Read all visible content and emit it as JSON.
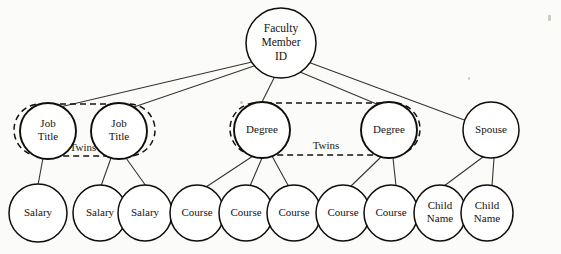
{
  "diagram": {
    "background_color": "#fbfbfa",
    "stroke_color": "#100d0b",
    "edge_color": "#3a332d",
    "nodes": [
      {
        "id": "root",
        "label_lines": [
          "Faculty",
          "Member",
          "ID"
        ],
        "cx": 281,
        "cy": 43,
        "rx": 35,
        "ry": 35,
        "font_size": 11.5,
        "stroke_width": 1.5
      },
      {
        "id": "job1",
        "label_lines": [
          "Job",
          "Title"
        ],
        "cx": 48,
        "cy": 131,
        "rx": 28,
        "ry": 28,
        "font_size": 11,
        "stroke_width": 1.9
      },
      {
        "id": "job2",
        "label_lines": [
          "Job",
          "Title"
        ],
        "cx": 119,
        "cy": 131,
        "rx": 28,
        "ry": 28,
        "font_size": 11,
        "stroke_width": 1.9
      },
      {
        "id": "degree1",
        "label_lines": [
          "Degree"
        ],
        "cx": 262,
        "cy": 130,
        "rx": 28,
        "ry": 28,
        "font_size": 11,
        "stroke_width": 1.9
      },
      {
        "id": "degree2",
        "label_lines": [
          "Degree"
        ],
        "cx": 389,
        "cy": 130,
        "rx": 28,
        "ry": 28,
        "font_size": 11,
        "stroke_width": 1.9
      },
      {
        "id": "spouse",
        "label_lines": [
          "Spouse"
        ],
        "cx": 491,
        "cy": 130,
        "rx": 28,
        "ry": 28,
        "font_size": 11,
        "stroke_width": 1.5
      },
      {
        "id": "salary1",
        "label_lines": [
          "Salary"
        ],
        "cx": 38,
        "cy": 213,
        "rx": 29,
        "ry": 29,
        "font_size": 11,
        "stroke_width": 1.5
      },
      {
        "id": "salary2",
        "label_lines": [
          "Salary"
        ],
        "cx": 100,
        "cy": 213,
        "rx": 27,
        "ry": 28,
        "font_size": 11,
        "stroke_width": 1.5
      },
      {
        "id": "salary3",
        "label_lines": [
          "Salary"
        ],
        "cx": 145,
        "cy": 213,
        "rx": 27,
        "ry": 28,
        "font_size": 11,
        "stroke_width": 1.5
      },
      {
        "id": "course1",
        "label_lines": [
          "Course"
        ],
        "cx": 197,
        "cy": 213,
        "rx": 27,
        "ry": 28,
        "font_size": 11,
        "stroke_width": 1.5
      },
      {
        "id": "course2",
        "label_lines": [
          "Course"
        ],
        "cx": 246,
        "cy": 213,
        "rx": 27,
        "ry": 28,
        "font_size": 11,
        "stroke_width": 1.5
      },
      {
        "id": "course3",
        "label_lines": [
          "Course"
        ],
        "cx": 294,
        "cy": 213,
        "rx": 27,
        "ry": 28,
        "font_size": 11,
        "stroke_width": 1.5
      },
      {
        "id": "course4",
        "label_lines": [
          "Course"
        ],
        "cx": 343,
        "cy": 213,
        "rx": 27,
        "ry": 28,
        "font_size": 11,
        "stroke_width": 1.5
      },
      {
        "id": "course5",
        "label_lines": [
          "Course"
        ],
        "cx": 391,
        "cy": 213,
        "rx": 27,
        "ry": 28,
        "font_size": 11,
        "stroke_width": 1.5
      },
      {
        "id": "child1",
        "label_lines": [
          "Child",
          "Name"
        ],
        "cx": 440,
        "cy": 213,
        "rx": 26,
        "ry": 28,
        "font_size": 11,
        "stroke_width": 1.5
      },
      {
        "id": "child2",
        "label_lines": [
          "Child",
          "Name"
        ],
        "cx": 487,
        "cy": 213,
        "rx": 26,
        "ry": 28,
        "font_size": 11,
        "stroke_width": 1.5
      }
    ],
    "edges": [
      {
        "from": "root",
        "to": "job1",
        "x1": 252,
        "y1": 62,
        "x2": 60,
        "y2": 107
      },
      {
        "from": "root",
        "to": "job2",
        "x1": 254,
        "y1": 66,
        "x2": 131,
        "y2": 108
      },
      {
        "from": "root",
        "to": "degree1",
        "x1": 274,
        "y1": 78,
        "x2": 262,
        "y2": 102
      },
      {
        "from": "root",
        "to": "degree2",
        "x1": 300,
        "y1": 72,
        "x2": 379,
        "y2": 105
      },
      {
        "from": "root",
        "to": "spouse",
        "x1": 308,
        "y1": 62,
        "x2": 467,
        "y2": 121
      },
      {
        "from": "job1",
        "to": "salary1",
        "x1": 43,
        "y1": 158,
        "x2": 38,
        "y2": 185
      },
      {
        "from": "job2",
        "to": "salary2",
        "x1": 111,
        "y1": 158,
        "x2": 101,
        "y2": 186
      },
      {
        "from": "job2",
        "to": "salary3",
        "x1": 126,
        "y1": 158,
        "x2": 146,
        "y2": 186
      },
      {
        "from": "degree1",
        "to": "course1",
        "x1": 253,
        "y1": 156,
        "x2": 206,
        "y2": 187
      },
      {
        "from": "degree1",
        "to": "course2",
        "x1": 262,
        "y1": 158,
        "x2": 250,
        "y2": 186
      },
      {
        "from": "degree1",
        "to": "course3",
        "x1": 272,
        "y1": 156,
        "x2": 289,
        "y2": 187
      },
      {
        "from": "degree2",
        "to": "course4",
        "x1": 381,
        "y1": 157,
        "x2": 350,
        "y2": 187
      },
      {
        "from": "degree2",
        "to": "course5",
        "x1": 393,
        "y1": 158,
        "x2": 396,
        "y2": 186
      },
      {
        "from": "spouse",
        "to": "child1",
        "x1": 483,
        "y1": 157,
        "x2": 444,
        "y2": 186
      },
      {
        "from": "spouse",
        "to": "child2",
        "x1": 494,
        "y1": 158,
        "x2": 492,
        "y2": 186
      }
    ],
    "groups": [
      {
        "id": "twins-job-title",
        "label": "Twins",
        "x": 14,
        "y": 104,
        "width": 141,
        "height": 52,
        "radius": 26,
        "label_x": 83,
        "label_y": 148,
        "font_size": 11
      },
      {
        "id": "twins-degree",
        "label": "Twins",
        "x": 230,
        "y": 103,
        "width": 190,
        "height": 52,
        "radius": 26,
        "label_x": 326,
        "label_y": 146,
        "font_size": 11
      }
    ],
    "specks": [
      {
        "x": 548,
        "y": 15,
        "w": 3,
        "h": 6
      },
      {
        "x": 468,
        "y": 77,
        "w": 2,
        "h": 3
      },
      {
        "x": 240,
        "y": 101,
        "w": 3,
        "h": 3
      }
    ]
  }
}
